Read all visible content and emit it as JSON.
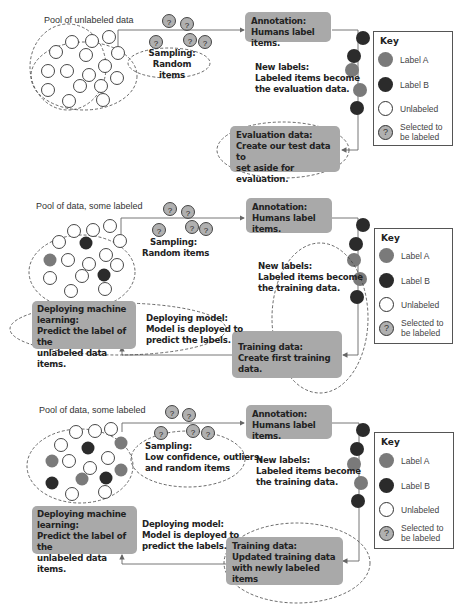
{
  "colors": {
    "label_a": "#7a7a7a",
    "label_b": "#2b2b2b",
    "unlabeled": "#ffffff",
    "selected": "#b0b0b0",
    "box_fill": "#a9a9a9"
  },
  "key": {
    "title": "Key",
    "items": [
      {
        "label": "Label A",
        "icon": "label-a-circle"
      },
      {
        "label": "Label B",
        "icon": "label-b-circle"
      },
      {
        "label": "Unlabeled",
        "icon": "unlabeled-circle"
      },
      {
        "label": "Selected to be labeled",
        "line1": "Selected to",
        "line2": "be labeled",
        "icon": "question-circle",
        "glyph": "?"
      }
    ]
  },
  "panels": [
    {
      "pool_label": "Pool of unlabeled data",
      "sampling": {
        "title": "Sampling:",
        "line1": "Random items",
        "line2": ""
      },
      "annotation": {
        "title": "Annotation:",
        "line1": "Humans label items."
      },
      "new_labels": {
        "title": "New labels:",
        "line1": "Labeled items become",
        "line2": "the evaluation data."
      },
      "evaluation": {
        "title": "Evaluation data:",
        "line1": "Create our test data to",
        "line2": "set aside for evaluation."
      }
    },
    {
      "pool_label": "Pool of data, some labeled",
      "sampling": {
        "title": "Sampling:",
        "line1": "Random items",
        "line2": ""
      },
      "annotation": {
        "title": "Annotation:",
        "line1": "Humans label items."
      },
      "new_labels": {
        "title": "New labels:",
        "line1": "Labeled items become",
        "line2": "the training data."
      },
      "training": {
        "title": "Training data:",
        "line1": "Create first training data.",
        "line2": ""
      },
      "deploy_ml": {
        "title": "Deploying machine",
        "line1": "learning:",
        "line2": "Predict the label of the",
        "line3": "unlabeled data items."
      },
      "deploy_model": {
        "title": "Deploying model:",
        "line1": "Model is deployed to",
        "line2": "predict the labels."
      }
    },
    {
      "pool_label": "Pool of data, some labeled",
      "sampling": {
        "title": "Sampling:",
        "line1": "Low confidence, outliers,",
        "line2": "and random items"
      },
      "annotation": {
        "title": "Annotation:",
        "line1": "Humans label items."
      },
      "new_labels": {
        "title": "New labels:",
        "line1": "Labeled items become",
        "line2": "the training data."
      },
      "training": {
        "title": "Training data:",
        "line1": "Updated training data",
        "line2": "with newly labeled items"
      },
      "deploy_ml": {
        "title": "Deploying machine",
        "line1": "learning:",
        "line2": "Predict the label of the",
        "line3": "unlabeled data items."
      },
      "deploy_model": {
        "title": "Deploying model:",
        "line1": "Model is deployed to",
        "line2": "predict the labels."
      }
    }
  ]
}
